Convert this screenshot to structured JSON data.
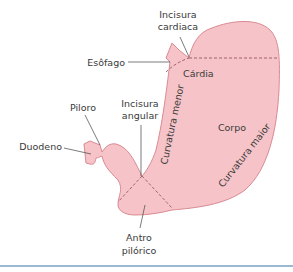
{
  "diagram": {
    "colors": {
      "organ_fill": "#f6c4c8",
      "organ_stroke": "#d98a92",
      "dashed_line": "#8c4a55",
      "leader_line": "#444444",
      "label_text": "#3a3a3a",
      "bottom_rule": "#9bb9d3"
    },
    "labels": {
      "incisura_cardiaca": [
        "Incisura",
        "cardiaca"
      ],
      "esofago": "Esôfago",
      "cardia": "Cárdia",
      "piloro": "Piloro",
      "incisura_angular": [
        "Incisura",
        "angular"
      ],
      "duodeno": "Duodeno",
      "curvatura_menor": "Curvatura menor",
      "corpo": "Corpo",
      "curvatura_maior": "Curvatura maior",
      "antro_pilorico": [
        "Antro",
        "pilórico"
      ]
    }
  }
}
